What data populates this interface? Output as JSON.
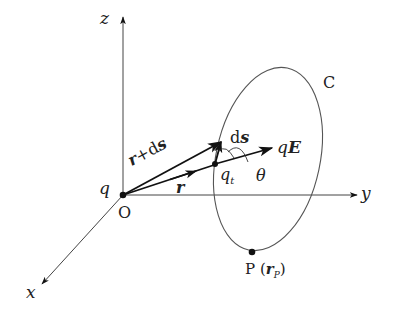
{
  "diagram": {
    "type": "3d-coordinate-vector-diagram",
    "axes": {
      "z": "z",
      "y": "y",
      "x": "x",
      "origin": "O"
    },
    "charges": {
      "source": "q",
      "test": "q",
      "test_subscript": "t"
    },
    "vectors": {
      "r": "r",
      "r_plus_ds_bold_r": "r",
      "r_plus_ds_op": "+",
      "r_plus_ds_d": "d",
      "r_plus_ds_s": "s",
      "ds_d": "d",
      "ds_s": "s",
      "force_q": "q",
      "force_E": "E"
    },
    "angle": "θ",
    "curve": "C",
    "point": {
      "name": "P",
      "open": "(",
      "vec": "r",
      "sub": "P",
      "close": ")"
    },
    "colors": {
      "stroke": "#111111",
      "axis": "#444444",
      "curve": "#555555"
    }
  }
}
